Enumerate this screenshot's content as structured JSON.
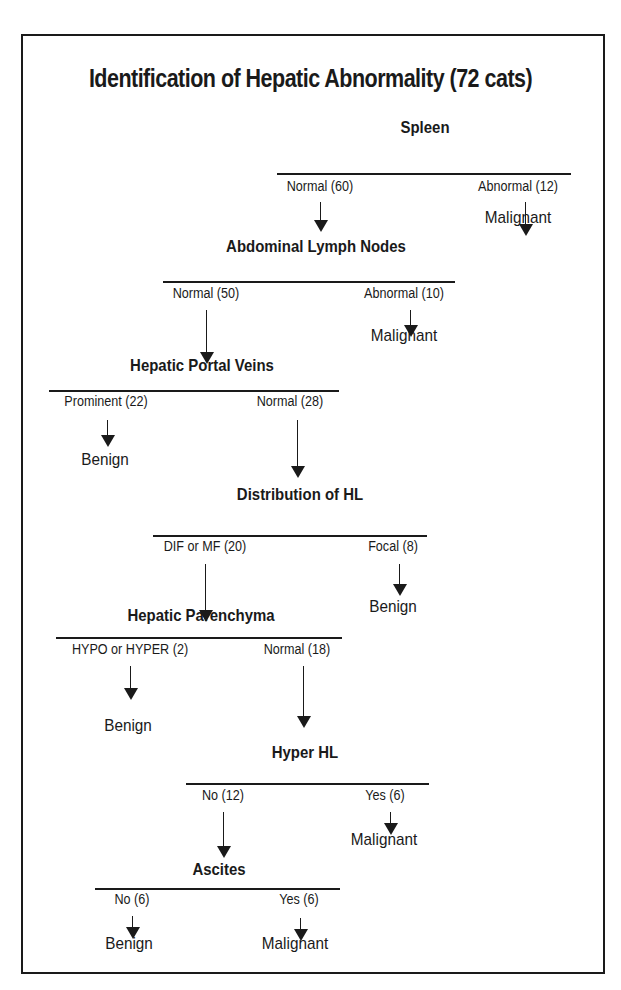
{
  "title": "Identification of Hepatic Abnormality (72 cats)",
  "nodes": [
    {
      "label": "Spleen",
      "branches": [
        {
          "label": "Normal (60)",
          "outcome": null
        },
        {
          "label": "Abnormal (12)",
          "outcome": "Malignant"
        }
      ]
    },
    {
      "label": "Abdominal Lymph Nodes",
      "branches": [
        {
          "label": "Normal (50)",
          "outcome": null
        },
        {
          "label": "Abnormal (10)",
          "outcome": "Malignant"
        }
      ]
    },
    {
      "label": "Hepatic Portal Veins",
      "branches": [
        {
          "label": "Prominent (22)",
          "outcome": "Benign"
        },
        {
          "label": "Normal (28)",
          "outcome": null
        }
      ]
    },
    {
      "label": "Distribution of HL",
      "branches": [
        {
          "label": "DIF or MF (20)",
          "outcome": null
        },
        {
          "label": "Focal (8)",
          "outcome": "Benign"
        }
      ]
    },
    {
      "label": "Hepatic Parenchyma",
      "branches": [
        {
          "label": "HYPO or HYPER (2)",
          "outcome": "Benign"
        },
        {
          "label": "Normal (18)",
          "outcome": null
        }
      ]
    },
    {
      "label": "Hyper HL",
      "branches": [
        {
          "label": "No (12)",
          "outcome": null
        },
        {
          "label": "Yes (6)",
          "outcome": "Malignant"
        }
      ]
    },
    {
      "label": "Ascites",
      "branches": [
        {
          "label": "No (6)",
          "outcome": "Benign"
        },
        {
          "label": "Yes (6)",
          "outcome": "Malignant"
        }
      ]
    }
  ]
}
